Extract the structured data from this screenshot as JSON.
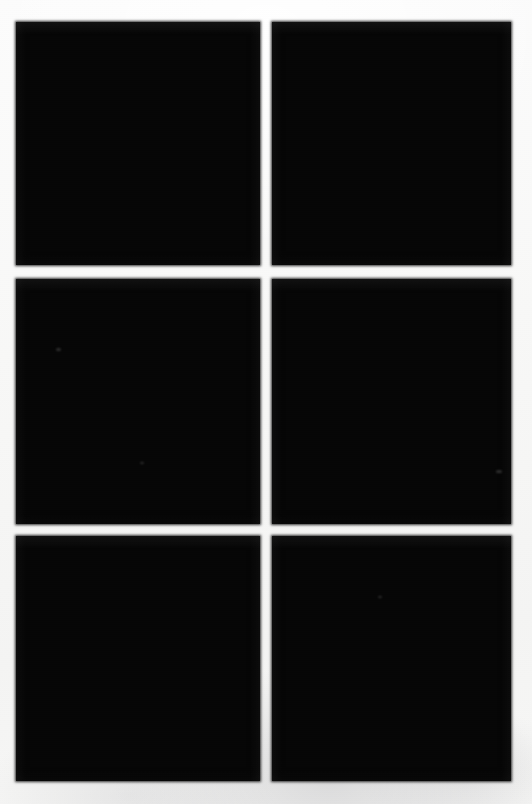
{
  "page": {
    "width": 532,
    "height": 804,
    "background_color": "#f7f7f6",
    "paper_note": ""
  },
  "grid": {
    "columns": 2,
    "rows": 3,
    "gutter_x": 12,
    "gutter_y": 13,
    "tile_color": "#060606",
    "tiles": [
      {
        "id": "tile-1",
        "position": "top-left",
        "row": 1,
        "column": 1,
        "x": 16,
        "y": 22,
        "width": 244,
        "height": 243,
        "fill": "#060606",
        "label": ""
      },
      {
        "id": "tile-2",
        "position": "top-right",
        "row": 1,
        "column": 2,
        "x": 272,
        "y": 22,
        "width": 239,
        "height": 243,
        "fill": "#060606",
        "label": ""
      },
      {
        "id": "tile-3",
        "position": "middle-left",
        "row": 2,
        "column": 1,
        "x": 16,
        "y": 279,
        "width": 244,
        "height": 245,
        "fill": "#060606",
        "label": ""
      },
      {
        "id": "tile-4",
        "position": "middle-right",
        "row": 2,
        "column": 2,
        "x": 272,
        "y": 279,
        "width": 239,
        "height": 245,
        "fill": "#060606",
        "label": ""
      },
      {
        "id": "tile-5",
        "position": "bottom-left",
        "row": 3,
        "column": 1,
        "x": 16,
        "y": 536,
        "width": 244,
        "height": 245,
        "fill": "#060606",
        "label": ""
      },
      {
        "id": "tile-6",
        "position": "bottom-right",
        "row": 3,
        "column": 2,
        "x": 272,
        "y": 536,
        "width": 239,
        "height": 245,
        "fill": "#060606",
        "label": ""
      }
    ]
  },
  "artifacts": {
    "specks": [
      {
        "id": "speck-1",
        "x": 56,
        "y": 348,
        "size": 5
      },
      {
        "id": "speck-2",
        "x": 496,
        "y": 470,
        "size": 6
      },
      {
        "id": "speck-3",
        "x": 140,
        "y": 462,
        "size": 4
      },
      {
        "id": "speck-4",
        "x": 378,
        "y": 596,
        "size": 4
      }
    ]
  }
}
